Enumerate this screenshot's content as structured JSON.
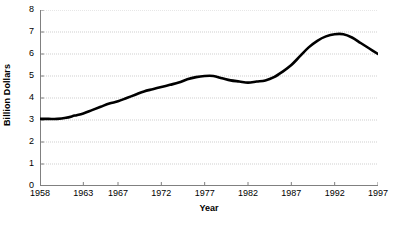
{
  "chart_data": {
    "type": "line",
    "title": "",
    "xlabel": "Year",
    "ylabel": "Billion Dollars",
    "xlim": [
      1958,
      1997
    ],
    "ylim": [
      0,
      8
    ],
    "grid": true,
    "legend": "none",
    "xticks": [
      "1958",
      "1963",
      "1967",
      "1972",
      "1977",
      "1982",
      "1987",
      "1992",
      "1997"
    ],
    "xtick_values": [
      1958,
      1963,
      1967,
      1972,
      1977,
      1982,
      1987,
      1992,
      1997
    ],
    "yticks": [
      "0",
      "1",
      "2",
      "3",
      "4",
      "5",
      "6",
      "7",
      "8"
    ],
    "ytick_values": [
      0,
      1,
      2,
      3,
      4,
      5,
      6,
      7,
      8
    ],
    "series": [
      {
        "name": "Billion Dollars",
        "color": "#000000",
        "x": [
          1958,
          1959,
          1960,
          1961,
          1962,
          1963,
          1964,
          1965,
          1966,
          1967,
          1968,
          1969,
          1970,
          1971,
          1972,
          1973,
          1974,
          1975,
          1976,
          1977,
          1978,
          1979,
          1980,
          1981,
          1982,
          1983,
          1984,
          1985,
          1986,
          1987,
          1988,
          1989,
          1990,
          1991,
          1992,
          1993,
          1994,
          1995,
          1996,
          1997
        ],
        "values": [
          3.05,
          3.05,
          3.05,
          3.1,
          3.2,
          3.3,
          3.45,
          3.6,
          3.75,
          3.85,
          4.0,
          4.15,
          4.3,
          4.4,
          4.5,
          4.6,
          4.7,
          4.85,
          4.95,
          5.0,
          5.0,
          4.9,
          4.8,
          4.75,
          4.7,
          4.75,
          4.8,
          4.95,
          5.2,
          5.5,
          5.9,
          6.3,
          6.6,
          6.8,
          6.9,
          6.9,
          6.75,
          6.5,
          6.25,
          6.0
        ]
      }
    ],
    "colors": {
      "line": "#000000",
      "grid": "#cfcfcf",
      "axis": "#808080",
      "background": "#ffffff"
    }
  }
}
